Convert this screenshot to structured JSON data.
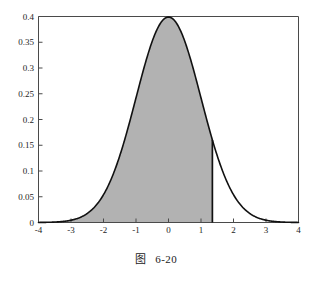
{
  "caption": {
    "label": "图",
    "number": "6-20"
  },
  "chart_data": {
    "type": "area",
    "title": "",
    "subtitle": "",
    "xlabel": "",
    "ylabel": "",
    "distribution": {
      "name": "standard normal",
      "mean": 0,
      "sd": 1,
      "peak_value": 0.399
    },
    "xlim": [
      -4,
      4
    ],
    "ylim": [
      0,
      0.4
    ],
    "grid": false,
    "legend": false,
    "legend_position": "none",
    "xticks": [
      -4,
      -3,
      -2,
      -1,
      0,
      1,
      2,
      3,
      4
    ],
    "xtick_labels": [
      "-4",
      "-3",
      "-2",
      "-1",
      "0",
      "1",
      "2",
      "3",
      "4"
    ],
    "yticks": [
      0,
      0.05,
      0.1,
      0.15,
      0.2,
      0.25,
      0.3,
      0.35,
      0.4
    ],
    "ytick_labels": [
      "0",
      "0.05",
      "0.1",
      "0.15",
      "0.2",
      "0.25",
      "0.3",
      "0.35",
      "0.4"
    ],
    "shaded_region": {
      "from": -4,
      "to": 1.35,
      "boundary_x": 1.35,
      "boundary_height": 0.1604,
      "fill_color": "#b2b2b2"
    },
    "curve_color": "#111111",
    "axis_color": "#4a4a4a",
    "x": [
      -4,
      -3.8,
      -3.6,
      -3.4,
      -3.2,
      -3,
      -2.8,
      -2.6,
      -2.4,
      -2.2,
      -2,
      -1.8,
      -1.6,
      -1.4,
      -1.2,
      -1,
      -0.8,
      -0.6,
      -0.4,
      -0.2,
      0,
      0.2,
      0.4,
      0.6,
      0.8,
      1,
      1.2,
      1.35,
      1.4,
      1.6,
      1.8,
      2,
      2.2,
      2.4,
      2.6,
      2.8,
      3,
      3.2,
      3.4,
      3.6,
      3.8,
      4
    ],
    "y": [
      0.0001,
      0.0003,
      0.0006,
      0.0012,
      0.0024,
      0.0044,
      0.0079,
      0.0136,
      0.0224,
      0.0355,
      0.054,
      0.079,
      0.1109,
      0.1497,
      0.1942,
      0.242,
      0.2897,
      0.3332,
      0.3683,
      0.391,
      0.3989,
      0.391,
      0.3683,
      0.3332,
      0.2897,
      0.242,
      0.1942,
      0.1604,
      0.1497,
      0.1109,
      0.079,
      0.054,
      0.0355,
      0.0224,
      0.0136,
      0.0079,
      0.0044,
      0.0024,
      0.0012,
      0.0006,
      0.0003,
      0.0001
    ]
  }
}
